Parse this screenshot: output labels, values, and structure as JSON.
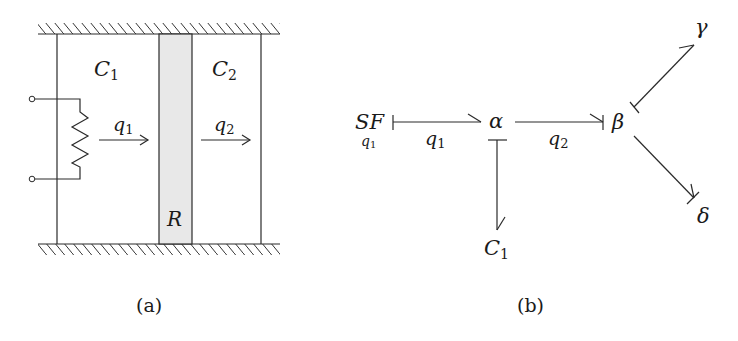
{
  "panel_a": {
    "caption": "(a)",
    "chamber_left_label": "C",
    "chamber_left_sub": "1",
    "chamber_right_label": "C",
    "chamber_right_sub": "2",
    "flow_left_label": "q",
    "flow_left_sub": "1",
    "flow_right_label": "q",
    "flow_right_sub": "2",
    "resistor_label": "R",
    "resistor_fill": "#e8e8e8"
  },
  "panel_b": {
    "caption": "(b)",
    "source_label": "SF",
    "source_sub": "q",
    "source_sub_index": "1",
    "junction_alpha": "α",
    "junction_beta": "β",
    "node_gamma": "γ",
    "node_delta": "δ",
    "node_c_label": "C",
    "node_c_sub": "1",
    "bond_1_label": "q",
    "bond_1_sub": "1",
    "bond_2_label": "q",
    "bond_2_sub": "2"
  }
}
